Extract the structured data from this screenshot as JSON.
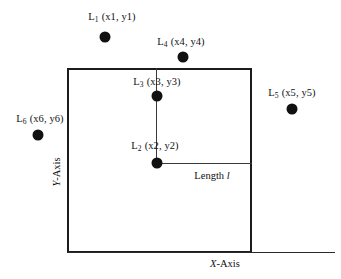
{
  "figure": {
    "title": "",
    "type": "geometric-point-diagram",
    "background_color": "#ffffff",
    "stroke_color": "#1c1c1c",
    "point_color": "#111111"
  },
  "axes": {
    "x_label": "X",
    "x_label_suffix": "-Axis",
    "y_label": "Y",
    "y_label_suffix": "-Axis"
  },
  "region": {
    "name": "bounding-square",
    "left": 67,
    "top": 68,
    "width": 185,
    "height": 185
  },
  "measure": {
    "prefix": "Length ",
    "symbol": "l"
  },
  "points": [
    {
      "id": "L1",
      "base": "L",
      "sub": "1",
      "coords": "(x1, y1)",
      "cx": 105,
      "cy": 37,
      "label_x": 112,
      "label_y": 17
    },
    {
      "id": "L2",
      "base": "L",
      "sub": "2",
      "coords": "(x2, y2)",
      "cx": 157,
      "cy": 163,
      "label_x": 155,
      "label_y": 146
    },
    {
      "id": "L3",
      "base": "L",
      "sub": "3",
      "coords": "(x3, y3)",
      "cx": 157,
      "cy": 96,
      "label_x": 157,
      "label_y": 82
    },
    {
      "id": "L4",
      "base": "L",
      "sub": "4",
      "coords": "(x4, y4)",
      "cx": 183,
      "cy": 57,
      "label_x": 181,
      "label_y": 42
    },
    {
      "id": "L5",
      "base": "L",
      "sub": "5",
      "coords": "(x5, y5)",
      "cx": 292,
      "cy": 109,
      "label_x": 292,
      "label_y": 93
    },
    {
      "id": "L6",
      "base": "L",
      "sub": "6",
      "coords": "(x6, y6)",
      "cx": 38,
      "cy": 135,
      "label_x": 40,
      "label_y": 119
    }
  ],
  "label_texts": {
    "l1": "L",
    "l1_sub": "1",
    "l1_coords": "(x1, y1)",
    "l2": "L",
    "l2_sub": "2",
    "l2_coords": "(x2, y2)",
    "l3": "L",
    "l3_sub": "3",
    "l3_coords": "(x3, y3)",
    "l4": "L",
    "l4_sub": "4",
    "l4_coords": "(x4, y4)",
    "l5": "L",
    "l5_sub": "5",
    "l5_coords": "(x5, y5)",
    "l6": "L",
    "l6_sub": "6",
    "l6_coords": "(x6, y6)"
  }
}
